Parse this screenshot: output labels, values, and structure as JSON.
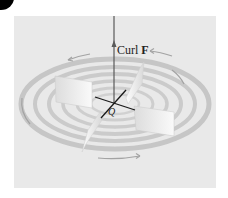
{
  "figure": {
    "labels": {
      "curl_text": "Curl ",
      "curl_bold": "F",
      "point": "Q"
    },
    "colors": {
      "background": "#ffffff",
      "panel": "#e9e9e9",
      "rings": "#b8b8b8",
      "arrows": "#a0a0a0",
      "axis": "#5a5a5a",
      "paddle": "#f7f7f7",
      "cross": "#1a1a1a",
      "corner_dot": "#000000"
    }
  }
}
